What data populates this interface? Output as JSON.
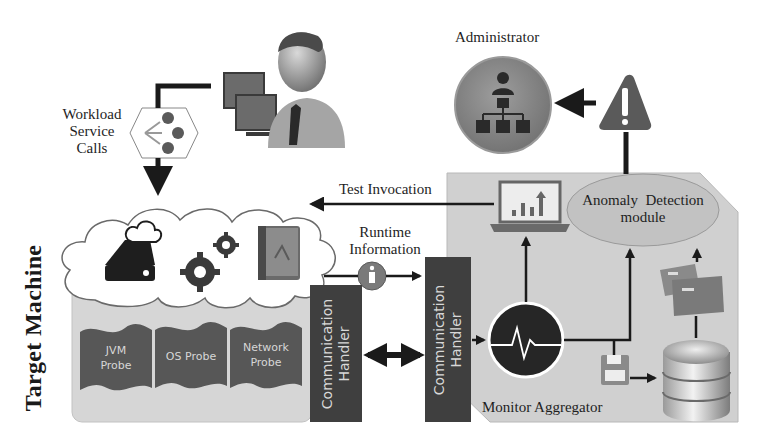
{
  "diagram": {
    "side_title": "Target Machine",
    "actors": {
      "user": {
        "icon": "user-at-workstation-icon"
      },
      "administrator": {
        "label": "Administrator",
        "icon": "org-chart-admin-icon"
      }
    },
    "labels": {
      "workload_line1": "Workload",
      "workload_line2": "Service",
      "workload_line3": "Calls",
      "test_invocation": "Test Invocation",
      "runtime_line1": "Runtime",
      "runtime_line2": "Information",
      "monitor_aggregator": "Monitor Aggregator",
      "anomaly_line1": "Anomaly  Detection",
      "anomaly_line2": "module"
    },
    "probes": [
      {
        "line1": "JVM",
        "line2": "Probe"
      },
      {
        "line1": "OS Probe",
        "line2": ""
      },
      {
        "line1": "Network",
        "line2": "Probe"
      }
    ],
    "handlers": [
      {
        "line1": "Communication",
        "line2": "Handler"
      },
      {
        "line1": "Communication",
        "line2": "Handler"
      }
    ],
    "icons": {
      "workload": "service-calls-hexagon-icon",
      "cloud_storage": "cloud-drive-icon",
      "gears": "gears-icon",
      "app": "application-book-icon",
      "info": "info-icon",
      "laptop": "laptop-chart-icon",
      "monitor": "heartbeat-monitor-icon",
      "floppy": "floppy-disk-icon",
      "database": "database-icon",
      "boxes": "archive-boxes-icon",
      "warning": "warning-triangle-icon"
    },
    "colors": {
      "panel_gray": "#cfcfcf",
      "handler_dark": "#3f3f3f",
      "probe_dark": "#555555",
      "admin_circle": "#8a8a8a",
      "warning": "#5a5a5a",
      "arrow": "#1a1a1a"
    }
  }
}
